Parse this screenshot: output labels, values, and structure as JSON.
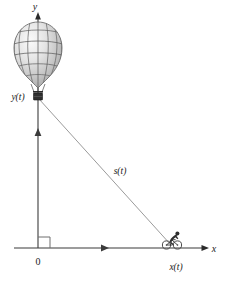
{
  "figure": {
    "type": "related-rates-diagram",
    "axes": {
      "y_axis_label": "y",
      "x_axis_label": "x",
      "origin_label": "0"
    },
    "labels": {
      "balloon_height": "y(t)",
      "cyclist_distance": "x(t)",
      "slant_distance": "s(t)"
    },
    "objects": {
      "balloon_name": "hot-air-balloon",
      "cyclist_name": "cyclist",
      "right_angle_name": "right-angle-mark",
      "vertical_velocity_arrow": "balloon-velocity-arrow",
      "horizontal_velocity_arrow": "cyclist-velocity-arrow"
    },
    "colors": {
      "line": "#3b3b3b",
      "thin_line": "#8a8a8a",
      "balloon_outline": "#6b6b6b",
      "balloon_fill_light": "#f2f2f2",
      "balloon_fill_mid": "#c9c9c9",
      "balloon_fill_dark": "#9a9a9a",
      "basket": "#2b2b2b",
      "text": "#1a1a1a",
      "background": "#ffffff"
    },
    "geometry": {
      "origin_px": [
        38,
        248
      ],
      "balloon_basket_px": [
        38,
        98
      ],
      "cyclist_px": [
        172,
        246
      ],
      "y_axis_top_px": [
        38,
        14
      ],
      "x_axis_right_px": [
        208,
        248
      ]
    }
  }
}
